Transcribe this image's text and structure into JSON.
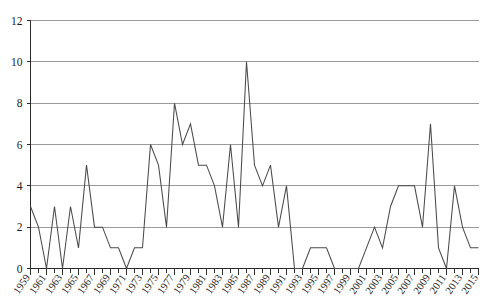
{
  "chart_data": {
    "type": "line",
    "title": "",
    "subtitle": "",
    "xlabel": "",
    "ylabel": "",
    "xlim": [
      1959,
      2015
    ],
    "ylim": [
      0,
      12
    ],
    "grid": true,
    "legend": false,
    "y_ticks": [
      0,
      2,
      4,
      6,
      8,
      10,
      12
    ],
    "x_tick_labels": [
      "1959",
      "1961",
      "1963",
      "1965",
      "1967",
      "1969",
      "1971",
      "1973",
      "1975",
      "1977",
      "1979",
      "1981",
      "1983",
      "1985",
      "1987",
      "1989",
      "1991",
      "1993",
      "1995",
      "1997",
      "1999",
      "2001",
      "2003",
      "2005",
      "2007",
      "2009",
      "2011",
      "2013",
      "2015"
    ],
    "x_tick_label_interval": 2,
    "x_minor_tick_interval": 1,
    "x": [
      1959,
      1960,
      1961,
      1962,
      1963,
      1964,
      1965,
      1966,
      1967,
      1968,
      1969,
      1970,
      1971,
      1972,
      1973,
      1974,
      1975,
      1976,
      1977,
      1978,
      1979,
      1980,
      1981,
      1982,
      1983,
      1984,
      1985,
      1986,
      1987,
      1988,
      1989,
      1990,
      1991,
      1992,
      1993,
      1994,
      1995,
      1996,
      1997,
      1998,
      1999,
      2000,
      2001,
      2002,
      2003,
      2004,
      2005,
      2006,
      2007,
      2008,
      2009,
      2010,
      2011,
      2012,
      2013,
      2014,
      2015
    ],
    "values": [
      3,
      2,
      0,
      3,
      0,
      3,
      1,
      5,
      2,
      2,
      1,
      1,
      0,
      1,
      1,
      6,
      5,
      2,
      8,
      6,
      7,
      5,
      5,
      4,
      2,
      6,
      2,
      10,
      5,
      4,
      5,
      2,
      4,
      0,
      0,
      1,
      1,
      1,
      0,
      0,
      0,
      0,
      1,
      2,
      1,
      3,
      4,
      4,
      4,
      2,
      7,
      1,
      0,
      4,
      2,
      1,
      1
    ],
    "series": [
      {
        "name": "series-1",
        "color": "#4a4a4a",
        "values": [
          3,
          2,
          0,
          3,
          0,
          3,
          1,
          5,
          2,
          2,
          1,
          1,
          0,
          1,
          1,
          6,
          5,
          2,
          8,
          6,
          7,
          5,
          5,
          4,
          2,
          6,
          2,
          10,
          5,
          4,
          5,
          2,
          4,
          0,
          0,
          1,
          1,
          1,
          0,
          0,
          0,
          0,
          1,
          2,
          1,
          3,
          4,
          4,
          4,
          2,
          7,
          1,
          0,
          4,
          2,
          1,
          1
        ]
      }
    ],
    "colors": {
      "line": "#4a4a4a",
      "grid": "#9a9a9a",
      "axis": "#2b2b2b",
      "background": "#ffffff",
      "text": "#1c1c1c"
    }
  }
}
